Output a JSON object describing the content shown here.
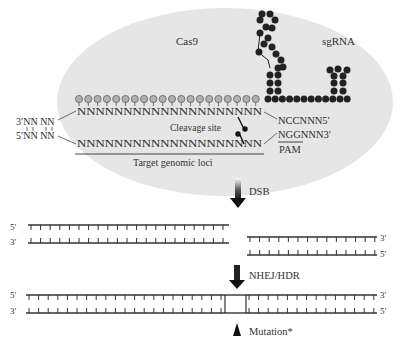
{
  "colors": {
    "cas9_fill": "#e6e6e6",
    "sgrna_bead": "#222222",
    "guide_bead": "#9a9a9a",
    "strand": "#333333",
    "label": "#333333"
  },
  "complex": {
    "cas9_label": "Cas9",
    "sgrna_label": "sgRNA",
    "cleavage_label": "Cleavage site",
    "target_label": "Target genomic loci",
    "pam_label": "PAM",
    "top_strand_seq": "NNNNNNNNNNNNNNNNNNNN",
    "bottom_strand_seq": "NNNNNNNNNNNNNNNNNNNN",
    "left_top": "3′NN NN",
    "left_bottom": "5′NN NN",
    "right_top": "NCCNNN5′",
    "right_bottom": "NGGNNN3′"
  },
  "steps": [
    {
      "label": "DSB"
    },
    {
      "label": "NHEJ/HDR"
    }
  ],
  "dsb_product": {
    "left": {
      "top_end": "5′",
      "bottom_end": "3′"
    },
    "right": {
      "top_end": "3′",
      "bottom_end": "5′"
    }
  },
  "repaired": {
    "left_top": "5′",
    "left_bottom": "3′",
    "right_top": "3′",
    "right_bottom": "5′",
    "mutation_label": "Mutation*"
  }
}
